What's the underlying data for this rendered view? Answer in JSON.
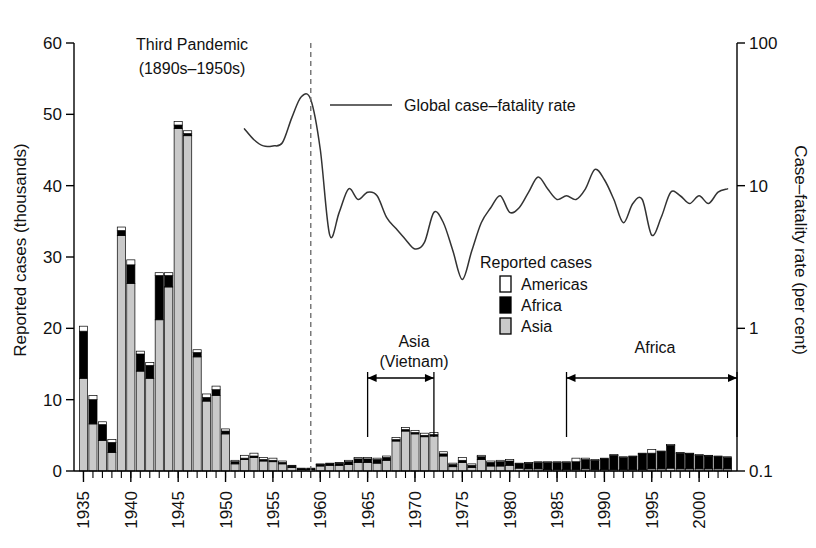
{
  "chart_data": {
    "type": "bar",
    "title": "",
    "combo": "stacked-bar-plus-line",
    "xlabel": "",
    "ylabel": "Reported cases (thousands)",
    "y2label": "Case-fatality rate (per cent)",
    "ylim": [
      0,
      60
    ],
    "yticks": [
      0,
      10,
      20,
      30,
      40,
      50,
      60
    ],
    "y2lim": [
      0.1,
      100
    ],
    "y2scale": "log",
    "y2ticks": [
      0.1,
      1,
      10,
      100
    ],
    "y2ticklabels": [
      "0.1",
      "1",
      "10",
      "100"
    ],
    "xlim": [
      1934,
      2004
    ],
    "xticks": [
      1935,
      1940,
      1945,
      1950,
      1955,
      1960,
      1965,
      1970,
      1975,
      1980,
      1985,
      1990,
      1995,
      2000
    ],
    "grid": false,
    "legend_position": "center-right",
    "legend_title": "Reported cases",
    "series_colors": {
      "americas": "#ffffff",
      "africa": "#000000",
      "asia": "#c9c9c9",
      "line": "#333333"
    },
    "categories": [
      1935,
      1936,
      1937,
      1938,
      1939,
      1940,
      1941,
      1942,
      1943,
      1944,
      1945,
      1946,
      1947,
      1948,
      1949,
      1950,
      1951,
      1952,
      1953,
      1954,
      1955,
      1956,
      1957,
      1958,
      1959,
      1960,
      1961,
      1962,
      1963,
      1964,
      1965,
      1966,
      1967,
      1968,
      1969,
      1970,
      1971,
      1972,
      1973,
      1974,
      1975,
      1976,
      1977,
      1978,
      1979,
      1980,
      1981,
      1982,
      1983,
      1984,
      1985,
      1986,
      1987,
      1988,
      1989,
      1990,
      1991,
      1992,
      1993,
      1994,
      1995,
      1996,
      1997,
      1998,
      1999,
      2000,
      2001,
      2002,
      2003
    ],
    "series": [
      {
        "name": "Asia",
        "key": "asia",
        "color": "#c9c9c9",
        "values": [
          13.0,
          6.6,
          4.3,
          2.6,
          33.0,
          26.3,
          14.0,
          13.0,
          21.2,
          25.8,
          48.0,
          47.0,
          16.0,
          9.8,
          10.6,
          5.2,
          1.0,
          1.6,
          1.9,
          1.4,
          1.3,
          1.0,
          0.5,
          0.2,
          0.2,
          0.7,
          0.8,
          0.8,
          0.9,
          1.2,
          1.2,
          1.1,
          1.5,
          4.2,
          5.6,
          5.2,
          4.8,
          4.9,
          2.1,
          0.6,
          1.2,
          0.5,
          1.6,
          0.7,
          0.7,
          0.8,
          0.4,
          0.3,
          0.3,
          0.2,
          0.2,
          0.2,
          0.2,
          0.3,
          0.2,
          0.2,
          0.2,
          0.2,
          0.2,
          0.2,
          0.3,
          0.3,
          0.4,
          0.3,
          0.3,
          0.3,
          0.3,
          0.3,
          0.3
        ]
      },
      {
        "name": "Africa",
        "key": "africa",
        "color": "#000000",
        "values": [
          6.6,
          3.4,
          2.2,
          1.4,
          0.7,
          2.6,
          2.4,
          1.8,
          6.2,
          1.6,
          0.5,
          0.3,
          0.6,
          0.5,
          0.8,
          0.4,
          0.3,
          0.2,
          0.2,
          0.2,
          0.2,
          0.2,
          0.2,
          0.1,
          0.1,
          0.2,
          0.2,
          0.3,
          0.4,
          0.5,
          0.5,
          0.5,
          0.4,
          0.2,
          0.2,
          0.2,
          0.2,
          0.2,
          0.3,
          0.3,
          0.3,
          0.3,
          0.4,
          0.5,
          0.6,
          0.6,
          0.6,
          0.8,
          0.9,
          1.0,
          1.0,
          1.0,
          1.1,
          1.3,
          1.3,
          1.5,
          2.0,
          1.7,
          1.8,
          2.2,
          2.2,
          2.4,
          3.2,
          2.2,
          2.1,
          1.9,
          1.8,
          1.7,
          1.6
        ]
      },
      {
        "name": "Americas",
        "key": "americas",
        "color": "#ffffff",
        "values": [
          0.7,
          0.6,
          0.4,
          0.4,
          0.5,
          0.7,
          0.4,
          0.4,
          0.4,
          0.4,
          0.5,
          0.4,
          0.4,
          0.5,
          0.5,
          0.3,
          0.2,
          0.4,
          0.4,
          0.3,
          0.3,
          0.2,
          0.1,
          0.1,
          0.1,
          0.1,
          0.1,
          0.1,
          0.2,
          0.2,
          0.2,
          0.2,
          0.2,
          0.3,
          0.3,
          0.3,
          0.3,
          0.3,
          0.3,
          0.2,
          0.4,
          0.2,
          0.2,
          0.2,
          0.2,
          0.2,
          0.1,
          0.1,
          0.1,
          0.1,
          0.1,
          0.1,
          0.5,
          0.2,
          0.1,
          0.1,
          0.1,
          0.1,
          0.1,
          0.1,
          0.5,
          0.1,
          0.1,
          0.1,
          0.1,
          0.1,
          0.1,
          0.1,
          0.1
        ]
      }
    ],
    "line_series": {
      "name": "Global case-fatality rate",
      "color": "#333333",
      "x": [
        1952,
        1953,
        1954,
        1955,
        1956,
        1957,
        1958,
        1959,
        1960,
        1961,
        1962,
        1963,
        1964,
        1965,
        1966,
        1967,
        1968,
        1969,
        1970,
        1971,
        1972,
        1973,
        1974,
        1975,
        1976,
        1977,
        1978,
        1979,
        1980,
        1981,
        1982,
        1983,
        1984,
        1985,
        1986,
        1987,
        1988,
        1989,
        1990,
        1991,
        1992,
        1993,
        1994,
        1995,
        1996,
        1997,
        1998,
        1999,
        2000,
        2001,
        2002,
        2003
      ],
      "y": [
        25,
        21,
        19,
        19,
        20,
        30,
        42,
        40,
        18,
        4.5,
        6.5,
        9.5,
        8.0,
        9.0,
        8.5,
        6.0,
        5.0,
        4.2,
        3.6,
        4.0,
        6.5,
        5.5,
        3.5,
        2.2,
        3.5,
        5.5,
        7.0,
        8.5,
        6.5,
        7.0,
        9.0,
        11.5,
        9.5,
        8.0,
        8.5,
        8.0,
        9.5,
        13.0,
        11.0,
        8.0,
        5.5,
        7.5,
        8.0,
        4.5,
        6.0,
        9.0,
        8.5,
        7.5,
        8.5,
        7.5,
        9.0,
        9.5
      ]
    },
    "annotations": [
      {
        "name": "third-pandemic",
        "text": "Third Pandemic",
        "text2": "(1890s–1950s)"
      },
      {
        "name": "vietnam-bracket",
        "text": "Asia",
        "text2": "(Vietnam)",
        "x_start": 1965,
        "x_end": 1972
      },
      {
        "name": "africa-bracket",
        "text": "Africa",
        "x_start": 1986,
        "x_end": 2003
      },
      {
        "name": "pandemic-end-marker",
        "type": "vertical-dashed",
        "x": 1959
      }
    ]
  },
  "legend": {
    "title": "Reported cases",
    "items": [
      {
        "label": "Americas",
        "swatch": "white"
      },
      {
        "label": "Africa",
        "swatch": "black"
      },
      {
        "label": "Asia",
        "swatch": "gray"
      }
    ],
    "line_label": "Global case–fatality rate"
  },
  "axes": {
    "left_title": "Reported cases (thousands)",
    "right_title": "Case–fatality rate (per cent)",
    "left_ticks": [
      "0",
      "10",
      "20",
      "30",
      "40",
      "50",
      "60"
    ],
    "right_ticks": [
      "0.1",
      "1",
      "10",
      "100"
    ],
    "x_ticks": [
      "1935",
      "1940",
      "1945",
      "1950",
      "1955",
      "1960",
      "1965",
      "1970",
      "1975",
      "1980",
      "1985",
      "1990",
      "1995",
      "2000"
    ]
  },
  "annotations": {
    "pandemic_line1": "Third Pandemic",
    "pandemic_line2": "(1890s–1950s)",
    "vietnam_line1": "Asia",
    "vietnam_line2": "(Vietnam)",
    "africa_label": "Africa"
  }
}
